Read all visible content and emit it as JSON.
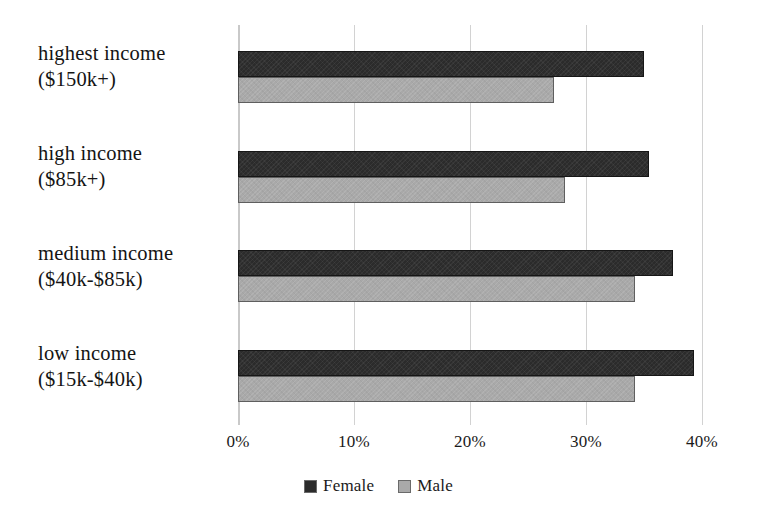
{
  "chart_data": {
    "type": "bar",
    "orientation": "horizontal",
    "title": "",
    "subtitle": "",
    "xlabel": "",
    "ylabel": "",
    "categories": [
      "highest income ($150k+)",
      "high income ($85k+)",
      "medium income ($40k-$85k)",
      "low income ($15k-$40k)"
    ],
    "category_lines": [
      [
        "highest income",
        "($150k+)"
      ],
      [
        "high income",
        "($85k+)"
      ],
      [
        "medium income",
        "($40k-$85k)"
      ],
      [
        "low income",
        "($15k-$40k)"
      ]
    ],
    "series": [
      {
        "name": "Female",
        "color": "#2b2b2b",
        "values": [
          35.0,
          35.4,
          37.5,
          39.3
        ]
      },
      {
        "name": "Male",
        "color": "#a9a9a9",
        "values": [
          27.2,
          28.2,
          34.2,
          34.2
        ]
      }
    ],
    "xlim": [
      0,
      40
    ],
    "xticks": [
      0,
      10,
      20,
      30,
      40
    ],
    "xtick_labels": [
      "0%",
      "10%",
      "20%",
      "30%",
      "40%"
    ],
    "grid": true,
    "grid_axis": "x",
    "legend_position": "bottom-center"
  },
  "legend": {
    "entries": [
      {
        "label": "Female"
      },
      {
        "label": "Male"
      }
    ]
  },
  "colors": {
    "female": "#2b2b2b",
    "male": "#a9a9a9",
    "gridline": "#d2d2d2",
    "axis": "#c9c9c9",
    "text": "#1a1a1a",
    "background": "#ffffff"
  }
}
